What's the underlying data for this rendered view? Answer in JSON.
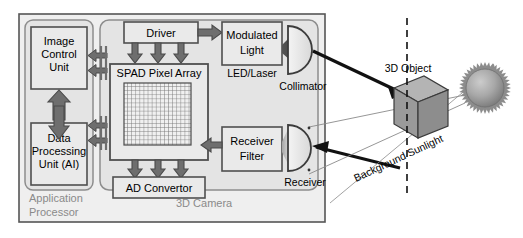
{
  "diagram": {
    "outer_group_label": "",
    "colors": {
      "box_fill": "#e8e8e8",
      "panel_fill": "#e2e2e2",
      "outer_fill": "#ededed",
      "arrow_fill": "#6e6e6e",
      "arrow_stroke": "#4a4a4a",
      "cube_front": "#9a9a9a",
      "cube_top": "#b4b4b4",
      "cube_side": "#8a8a8a",
      "sun_color": "#9e9e9e",
      "text": "#000000",
      "gray_text": "#8a8a8a",
      "line": "#444444"
    },
    "groups": [
      {
        "id": "application-processor",
        "label": "Application Processor"
      },
      {
        "id": "3d-camera",
        "label": "3D Camera"
      }
    ],
    "blocks": [
      {
        "id": "image-control-unit",
        "lines": [
          "Image",
          "Control",
          "Unit"
        ]
      },
      {
        "id": "data-processing-unit",
        "lines": [
          "Data",
          "Processing",
          "Unit (AI)"
        ]
      },
      {
        "id": "driver",
        "lines": [
          "Driver"
        ]
      },
      {
        "id": "modulated-light",
        "lines": [
          "Modulated",
          "Light"
        ],
        "caption": "LED/Laser"
      },
      {
        "id": "spad-pixel-array",
        "lines": [
          "SPAD Pixel Array"
        ]
      },
      {
        "id": "ad-convertor",
        "lines": [
          "AD Convertor"
        ]
      },
      {
        "id": "receiver-filter",
        "lines": [
          "Receiver",
          "Filter"
        ]
      }
    ],
    "optics": [
      {
        "id": "collimator",
        "label": "Collimator"
      },
      {
        "id": "receiver",
        "label": "Receiver"
      }
    ],
    "scene": [
      {
        "id": "3d-object",
        "label": "3D Object"
      },
      {
        "id": "background-sunlight",
        "label": "Background Sunlight"
      },
      {
        "id": "sun",
        "label": ""
      }
    ],
    "spad_grid": {
      "cols": 16,
      "rows": 14
    }
  }
}
